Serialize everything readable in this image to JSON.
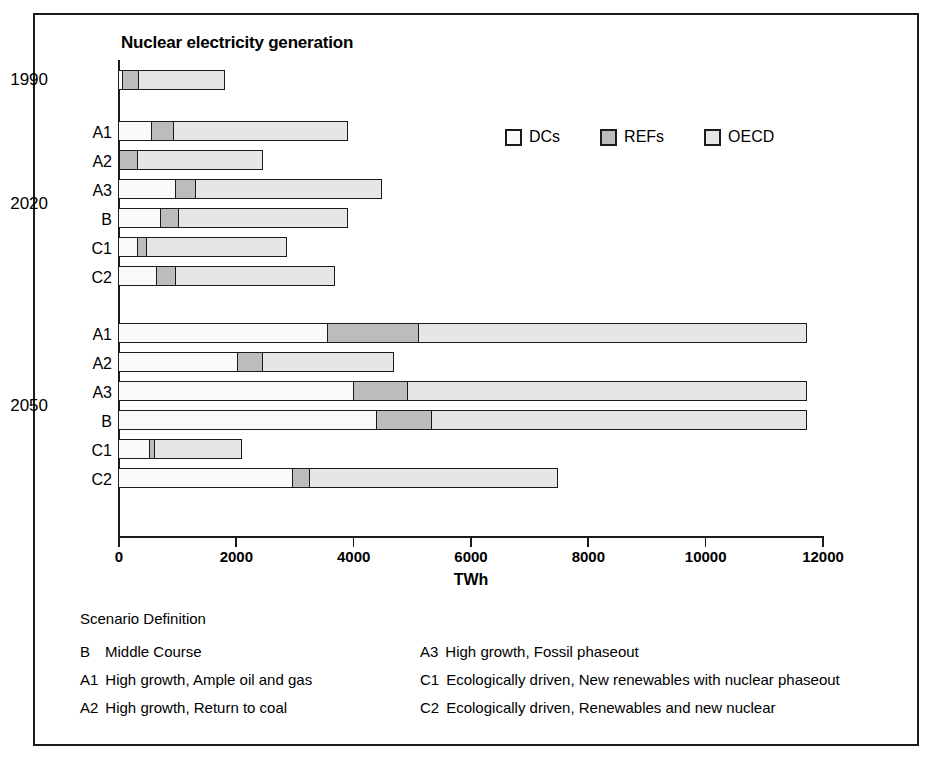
{
  "chart_data": {
    "type": "bar",
    "orientation": "horizontal",
    "stacked": true,
    "title": "Nuclear electricity generation",
    "xlabel": "TWh",
    "ylabel": "",
    "xlim": [
      0,
      12000
    ],
    "xticks": [
      0,
      2000,
      4000,
      6000,
      8000,
      10000,
      12000
    ],
    "xticklabels": [
      "0",
      "2000",
      "4000",
      "6000",
      "8000",
      "10000",
      "12000"
    ],
    "grid": false,
    "legend_position": "upper right inside",
    "series": [
      {
        "name": "DCs",
        "color": "#fafafa"
      },
      {
        "name": "REFs",
        "color": "#bcbcbc"
      },
      {
        "name": "OECD",
        "color": "#e6e6e6"
      }
    ],
    "groups": [
      {
        "label": "1990",
        "rows": [
          {
            "label": "",
            "DCs": 100,
            "REFs": 300,
            "OECD": 1490,
            "total": 1890
          }
        ]
      },
      {
        "label": "2020",
        "rows": [
          {
            "label": "A1",
            "DCs": 600,
            "REFs": 400,
            "OECD": 2990,
            "total": 3990
          },
          {
            "label": "A2",
            "DCs": 50,
            "REFs": 330,
            "OECD": 2160,
            "total": 2540
          },
          {
            "label": "A3",
            "DCs": 1000,
            "REFs": 380,
            "OECD": 3190,
            "total": 4570
          },
          {
            "label": "B",
            "DCs": 750,
            "REFs": 330,
            "OECD": 2910,
            "total": 3990
          },
          {
            "label": "C1",
            "DCs": 350,
            "REFs": 190,
            "OECD": 2410,
            "total": 2950
          },
          {
            "label": "C2",
            "DCs": 670,
            "REFs": 360,
            "OECD": 2730,
            "total": 3760
          }
        ]
      },
      {
        "label": "2050",
        "rows": [
          {
            "label": "A1",
            "DCs": 3600,
            "REFs": 1570,
            "OECD": 6630,
            "total": 11800
          },
          {
            "label": "A2",
            "DCs": 2060,
            "REFs": 460,
            "OECD": 2250,
            "total": 4770
          },
          {
            "label": "A3",
            "DCs": 4030,
            "REFs": 960,
            "OECD": 6810,
            "total": 11800
          },
          {
            "label": "B",
            "DCs": 4420,
            "REFs": 980,
            "OECD": 6400,
            "total": 11800
          },
          {
            "label": "C1",
            "DCs": 560,
            "REFs": 120,
            "OECD": 1500,
            "total": 2180
          },
          {
            "label": "C2",
            "DCs": 2990,
            "REFs": 320,
            "OECD": 4250,
            "total": 7560
          }
        ]
      }
    ]
  },
  "legend": [
    {
      "label": "DCs",
      "color": "#fafafa"
    },
    {
      "label": "REFs",
      "color": "#bcbcbc"
    },
    {
      "label": "OECD",
      "color": "#e6e6e6"
    }
  ],
  "scenario": {
    "heading": "Scenario Definition",
    "left_column": [
      {
        "key": "B",
        "text": "Middle Course"
      },
      {
        "key": "A1",
        "text": "High growth, Ample oil and gas"
      },
      {
        "key": "A2",
        "text": "High growth, Return to coal"
      }
    ],
    "right_column": [
      {
        "key": "A3",
        "text": "High growth, Fossil phaseout"
      },
      {
        "key": "C1",
        "text": "Ecologically driven, New renewables with nuclear phaseout"
      },
      {
        "key": "C2",
        "text": "Ecologically driven, Renewables and new nuclear"
      }
    ]
  }
}
